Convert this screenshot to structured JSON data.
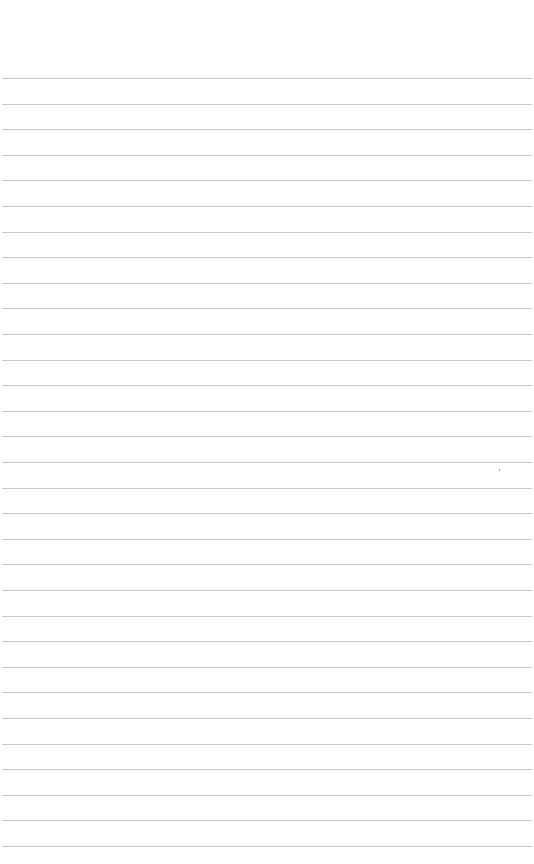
{
  "page": {
    "type": "ruled-paper",
    "background_color": "#ffffff",
    "line_color": "#c8c8c8",
    "line_count": 31,
    "first_line_y": 78,
    "line_spacing": 25.6,
    "text": ""
  }
}
